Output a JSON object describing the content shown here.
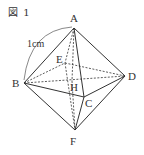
{
  "figure": {
    "title": "図 1",
    "shape": "regular octahedron",
    "edge_label": "1cm",
    "vertices": {
      "A": {
        "label": "A",
        "x": 74,
        "y": 28,
        "lx": 74,
        "ly": 21
      },
      "B": {
        "label": "B",
        "x": 24,
        "y": 83,
        "lx": 16,
        "ly": 87
      },
      "C": {
        "label": "C",
        "x": 84,
        "y": 97,
        "lx": 89,
        "ly": 107
      },
      "D": {
        "label": "D",
        "x": 125,
        "y": 76,
        "lx": 132,
        "ly": 80
      },
      "E": {
        "label": "E",
        "x": 65,
        "y": 63,
        "lx": 60,
        "ly": 62
      },
      "F": {
        "label": "F",
        "x": 75,
        "y": 130,
        "lx": 74,
        "ly": 143
      },
      "H": {
        "label": "H",
        "x": 72,
        "y": 81,
        "lx": 74,
        "ly": 91
      }
    },
    "solid_edges": [
      [
        "A",
        "B"
      ],
      [
        "A",
        "C"
      ],
      [
        "A",
        "D"
      ],
      [
        "B",
        "C"
      ],
      [
        "C",
        "D"
      ],
      [
        "B",
        "F"
      ],
      [
        "C",
        "F"
      ],
      [
        "D",
        "F"
      ]
    ],
    "dashed_edges": [
      [
        "A",
        "E"
      ],
      [
        "B",
        "E"
      ],
      [
        "E",
        "D"
      ],
      [
        "E",
        "F"
      ],
      [
        "B",
        "D"
      ],
      [
        "A",
        "H"
      ],
      [
        "H",
        "F"
      ]
    ],
    "colors": {
      "line": "#333333",
      "arc": "#555555",
      "text": "#333333"
    }
  }
}
